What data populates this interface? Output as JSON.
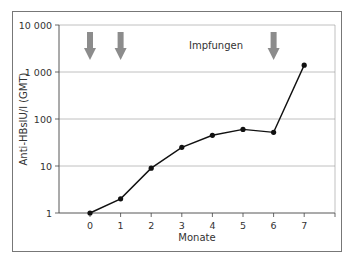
{
  "chart_data": {
    "type": "line",
    "title": "",
    "xlabel": "Monate",
    "ylabel": "Anti-HBsIU/l (GMT)",
    "yscale": "log",
    "ylim": [
      1,
      10000
    ],
    "yticks": [
      1,
      10,
      100,
      1000,
      10000
    ],
    "ytick_labels": [
      "1",
      "10",
      "100",
      "1 000",
      "10 000"
    ],
    "xticks": [
      0,
      1,
      2,
      3,
      4,
      5,
      6,
      7
    ],
    "x": [
      0,
      1,
      2,
      3,
      4,
      5,
      6,
      7
    ],
    "series": [
      {
        "name": "Anti-HBs GMT",
        "values": [
          1,
          2,
          9,
          25,
          45,
          60,
          52,
          1400
        ]
      }
    ],
    "grid": "horizontal",
    "annotations": [
      {
        "text": "Impfungen",
        "arrows_at_x": [
          0,
          1,
          6
        ]
      }
    ],
    "colors": {
      "line": "#111111",
      "arrow": "#8c8c8c",
      "grid": "#b0b0b0"
    }
  },
  "labels": {
    "xlabel": "Monate",
    "ylabel": "Anti-HBsIU/l (GMT)",
    "annotation": "Impfungen"
  }
}
